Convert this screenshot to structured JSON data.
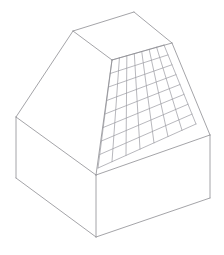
{
  "figure": {
    "type": "line-drawing",
    "background_color": "#ffffff",
    "canvas": {
      "width": 224,
      "height": 255
    }
  },
  "style": {
    "outline_color": "#8d8d92",
    "outline_width": 0.8,
    "grid_color": "#9a9aa0",
    "grid_width": 0.7,
    "face_fill": "#ffffff"
  },
  "geometry": {
    "units": "pixels",
    "vertices": {
      "base_left": [
        16,
        117
      ],
      "base_front": [
        96,
        175
      ],
      "base_right": [
        210,
        135
      ],
      "base_left_bottom": [
        16,
        178
      ],
      "base_front_bottom": [
        96,
        237
      ],
      "base_right_bottom": [
        210,
        198
      ],
      "eave_left": [
        16,
        117
      ],
      "eave_front": [
        96,
        175
      ],
      "eave_right": [
        210,
        135
      ],
      "ridge_left": [
        73,
        31
      ],
      "ridge_apex": [
        134,
        12
      ],
      "ridge_right": [
        172,
        43
      ],
      "hip_center": [
        112,
        60
      ]
    },
    "faces": [
      {
        "name": "base-left-wall",
        "points": "16,117 96,175 96,237 16,178"
      },
      {
        "name": "base-right-wall",
        "points": "96,175 210,135 210,198 96,237"
      },
      {
        "name": "roof-left-slope",
        "points": "16,117 73,31 134,12 112,60"
      },
      {
        "name": "roof-top-ridge",
        "points": "73,31 134,12 172,43 112,60"
      },
      {
        "name": "roof-front-right-slope",
        "points": "112,60 172,43 210,135 96,175"
      },
      {
        "name": "roof-left-gable-slope",
        "points": "16,117 112,60 96,175"
      }
    ],
    "outline_edges": [
      {
        "name": "ridge-left-to-apex",
        "from": [
          73,
          31
        ],
        "to": [
          134,
          12
        ]
      },
      {
        "name": "ridge-apex-to-right",
        "from": [
          134,
          12
        ],
        "to": [
          172,
          43
        ]
      },
      {
        "name": "ridge-right-to-center",
        "from": [
          172,
          43
        ],
        "to": [
          112,
          60
        ]
      },
      {
        "name": "ridge-center-to-left",
        "from": [
          112,
          60
        ],
        "to": [
          73,
          31
        ]
      },
      {
        "name": "hip-left-eave",
        "from": [
          73,
          31
        ],
        "to": [
          16,
          117
        ]
      },
      {
        "name": "hip-center-to-front-eave",
        "from": [
          112,
          60
        ],
        "to": [
          96,
          175
        ]
      },
      {
        "name": "hip-right-eave",
        "from": [
          172,
          43
        ],
        "to": [
          210,
          135
        ]
      },
      {
        "name": "eave-left-to-front",
        "from": [
          16,
          117
        ],
        "to": [
          96,
          175
        ]
      },
      {
        "name": "eave-front-to-right",
        "from": [
          96,
          175
        ],
        "to": [
          210,
          135
        ]
      },
      {
        "name": "wall-left-vertical",
        "from": [
          16,
          117
        ],
        "to": [
          16,
          178
        ]
      },
      {
        "name": "wall-front-vertical",
        "from": [
          96,
          175
        ],
        "to": [
          96,
          237
        ]
      },
      {
        "name": "wall-right-vertical",
        "from": [
          210,
          135
        ],
        "to": [
          210,
          198
        ]
      },
      {
        "name": "base-left-to-front",
        "from": [
          16,
          178
        ],
        "to": [
          96,
          237
        ]
      },
      {
        "name": "base-front-to-right",
        "from": [
          96,
          237
        ],
        "to": [
          210,
          198
        ]
      }
    ],
    "grid_panel": {
      "name": "roof-lattice-panel",
      "description": "Diagonal lattice of quadrilateral cells mapped onto the front-right roof slope.",
      "corners": {
        "top_left": [
          112,
          60
        ],
        "top_right": [
          164,
          45
        ],
        "bottom_right": [
          196,
          124
        ],
        "bottom_left": [
          98,
          168
        ]
      },
      "divisions_u": 7,
      "divisions_v": 8
    }
  }
}
